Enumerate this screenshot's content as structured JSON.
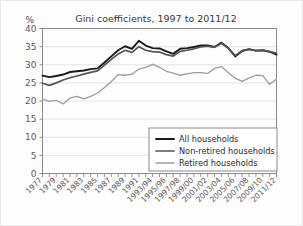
{
  "chart_data": {
    "type": "line",
    "title": "Gini coefficients, 1997 to 2011/12",
    "ylabel": "%",
    "xlabel": "",
    "ylim": [
      0,
      40
    ],
    "yticks": [
      0,
      5,
      10,
      15,
      20,
      25,
      30,
      35,
      40
    ],
    "grid": true,
    "legend_position": "bottom-right",
    "x": [
      "1977",
      "1978",
      "1979",
      "1980",
      "1981",
      "1982",
      "1983",
      "1984",
      "1985",
      "1986",
      "1987",
      "1988",
      "1989",
      "1990",
      "1991",
      "1992",
      "1993/94",
      "1994/95",
      "1995/96",
      "1996/97",
      "1997/98",
      "1998/99",
      "1999/00",
      "2000/01",
      "2001/02",
      "2002/03",
      "2003/04",
      "2004/05",
      "2005/06",
      "2006/07",
      "2007/08",
      "2008/09",
      "2009/10",
      "2010/11",
      "2011/12"
    ],
    "xtick_labels": [
      "1977",
      "1979",
      "1981",
      "1983",
      "1985",
      "1987",
      "1989",
      "1991",
      "1993/94",
      "1995/96",
      "1997/98",
      "1999/00",
      "2001/02",
      "2003/04",
      "2005/06",
      "2007/08",
      "2009/10",
      "2011/12"
    ],
    "series": [
      {
        "name": "All households",
        "color": "#1a1a1a",
        "width": 1.9,
        "values": [
          27.0,
          26.6,
          26.9,
          27.3,
          28.0,
          28.2,
          28.4,
          28.8,
          29.0,
          30.6,
          32.3,
          34.0,
          35.1,
          34.4,
          36.6,
          35.3,
          34.6,
          34.5,
          33.7,
          33.0,
          34.4,
          34.6,
          34.9,
          35.3,
          35.3,
          34.9,
          36.1,
          34.6,
          32.3,
          33.8,
          34.3,
          33.9,
          34.0,
          33.6,
          32.8
        ]
      },
      {
        "name": "Non-retired households",
        "color": "#555555",
        "width": 1.7,
        "values": [
          24.9,
          24.3,
          25.0,
          25.8,
          26.4,
          26.9,
          27.4,
          27.9,
          28.3,
          29.9,
          31.5,
          33.0,
          34.0,
          33.4,
          35.0,
          34.0,
          33.6,
          33.5,
          32.8,
          32.4,
          33.7,
          34.0,
          34.4,
          34.9,
          35.1,
          34.8,
          35.9,
          34.5,
          32.5,
          33.9,
          34.2,
          33.9,
          34.0,
          33.6,
          33.2
        ]
      },
      {
        "name": "Retired households",
        "color": "#9d9d9d",
        "width": 1.3,
        "values": [
          20.5,
          19.9,
          20.2,
          19.2,
          20.8,
          21.3,
          20.6,
          21.3,
          22.2,
          23.7,
          25.4,
          27.3,
          27.1,
          27.4,
          28.8,
          29.3,
          30.1,
          29.3,
          28.2,
          27.7,
          27.1,
          27.5,
          27.8,
          27.8,
          27.6,
          29.0,
          29.5,
          27.8,
          26.3,
          25.4,
          26.3,
          27.1,
          27.0,
          24.6,
          26.1
        ]
      }
    ]
  },
  "legend": {
    "items": [
      {
        "label": "All households"
      },
      {
        "label": "Non-retired households"
      },
      {
        "label": "Retired households"
      }
    ]
  }
}
